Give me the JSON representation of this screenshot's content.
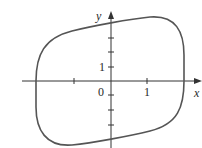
{
  "figure": {
    "type": "closed curve plot",
    "axes": {
      "x_label": "x",
      "y_label": "y",
      "origin_label": "0",
      "x_tick_label": "1",
      "y_tick_label": "1",
      "x_ticks": [
        -2,
        -1,
        1,
        2
      ],
      "y_ticks": [
        -4,
        -3,
        -2,
        -1,
        1,
        2,
        3,
        4
      ]
    },
    "curve": {
      "description": "closed loop, symmetric about origin, tilted rounded shape",
      "x_intercepts": [
        -2,
        2
      ],
      "y_intercepts": [
        -4,
        4
      ],
      "color": "#555555"
    },
    "colors": {
      "axis": "#333333",
      "curve": "#555555",
      "background": "#ffffff"
    }
  }
}
